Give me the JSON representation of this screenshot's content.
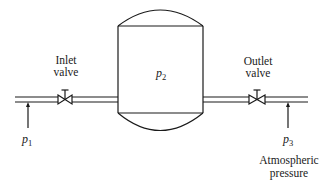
{
  "diagram": {
    "type": "pressurized-tank-flow-schematic",
    "tank": {
      "label_var": "p",
      "label_sub": "2"
    },
    "inlet_valve": {
      "label_line1": "Inlet",
      "label_line2": "valve"
    },
    "outlet_valve": {
      "label_line1": "Outlet",
      "label_line2": "valve"
    },
    "inlet_pressure": {
      "label_var": "p",
      "label_sub": "1"
    },
    "outlet_pressure": {
      "label_var": "p",
      "label_sub": "3",
      "note_line1": "Atmospheric",
      "note_line2": "pressure"
    },
    "colors": {
      "line": "#1a1a1a",
      "background": "#ffffff"
    }
  }
}
